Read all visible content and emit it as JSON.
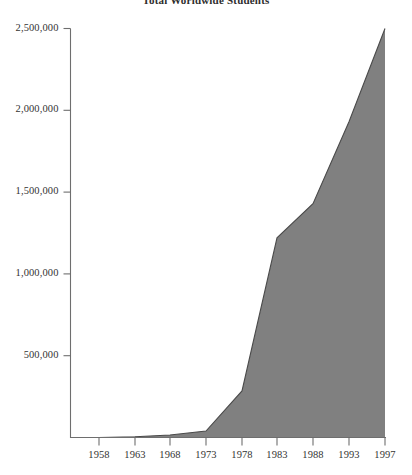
{
  "chart_data": {
    "type": "area",
    "title": "Total Worldwide Students",
    "xlabel": "",
    "ylabel": "",
    "x": [
      1958,
      1963,
      1968,
      1973,
      1978,
      1983,
      1988,
      1993,
      1997
    ],
    "values": [
      0,
      5000,
      15000,
      40000,
      285000,
      1220000,
      1430000,
      1930000,
      2500000
    ],
    "categories": [
      "1958",
      "1963",
      "1968",
      "1973",
      "1978",
      "1983",
      "1988",
      "1993",
      "1997"
    ],
    "xtick_labels": [
      "1958",
      "1963",
      "1968",
      "1973",
      "1978",
      "1983",
      "1988",
      "1993",
      "1997"
    ],
    "ytick_labels": [
      "500,000",
      "1,000,000",
      "1,500,000",
      "2,000,000",
      "2,500,000"
    ],
    "ytick_values": [
      500000,
      1000000,
      1500000,
      2000000,
      2500000
    ],
    "ylim": [
      0,
      2500000
    ],
    "xlim": [
      1958,
      1997
    ],
    "grid": false,
    "legend": "none",
    "fill_color": "#808080",
    "line_color": "#4a4a4a",
    "axis_color": "#6e6e6e"
  },
  "axes": {
    "y_axis_name": "y-axis",
    "x_axis_name": "x-axis"
  }
}
